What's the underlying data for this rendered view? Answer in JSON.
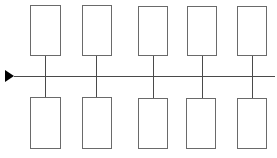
{
  "diagram": {
    "type": "timeline-branch",
    "colors": {
      "stroke": "#6a6a6a",
      "line": "#4a4a4a",
      "arrow": "#000000",
      "background": "#ffffff"
    },
    "arrow": {
      "x": 5,
      "y": 70,
      "direction": "right"
    },
    "main_line": {
      "x1": 14,
      "x2": 275,
      "y": 76
    },
    "top_boxes": [
      {
        "x": 30,
        "y": 5,
        "w": 31,
        "h": 51,
        "connector_x": 45
      },
      {
        "x": 82,
        "y": 5,
        "w": 30,
        "h": 51,
        "connector_x": 96
      },
      {
        "x": 138,
        "y": 6,
        "w": 30,
        "h": 50,
        "connector_x": 153
      },
      {
        "x": 187,
        "y": 6,
        "w": 30,
        "h": 50,
        "connector_x": 202
      },
      {
        "x": 237,
        "y": 6,
        "w": 30,
        "h": 50,
        "connector_x": 252
      }
    ],
    "bottom_boxes": [
      {
        "x": 30,
        "y": 97,
        "w": 31,
        "h": 52,
        "connector_x": 45
      },
      {
        "x": 82,
        "y": 97,
        "w": 30,
        "h": 52,
        "connector_x": 96
      },
      {
        "x": 138,
        "y": 98,
        "w": 30,
        "h": 51,
        "connector_x": 153
      },
      {
        "x": 186,
        "y": 98,
        "w": 30,
        "h": 51,
        "connector_x": 202
      },
      {
        "x": 237,
        "y": 98,
        "w": 30,
        "h": 51,
        "connector_x": 252
      }
    ]
  }
}
